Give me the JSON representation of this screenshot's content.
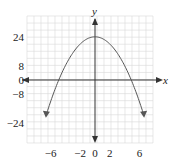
{
  "chart_data": {
    "type": "line",
    "title": "",
    "function": "y = 24 - x^2",
    "xlabel": "x",
    "ylabel": "y",
    "xlim": [
      -8.5,
      8.5
    ],
    "ylim": [
      -35,
      35
    ],
    "grid": true,
    "legend": null,
    "x_ticks": [
      {
        "value": -6,
        "label": "−6"
      },
      {
        "value": -2,
        "label": "−2"
      },
      {
        "value": 0,
        "label": "0"
      },
      {
        "value": 2,
        "label": "2"
      },
      {
        "value": 6,
        "label": "6"
      }
    ],
    "y_ticks": [
      {
        "value": 24,
        "label": "24"
      },
      {
        "value": 8,
        "label": "8"
      },
      {
        "value": 0,
        "label": "0"
      },
      {
        "value": -8,
        "label": "−8"
      },
      {
        "value": -24,
        "label": "−24"
      }
    ],
    "series": [
      {
        "name": "parabola",
        "x": [
          -6.6,
          -6,
          -5,
          -4,
          -3,
          -2,
          -1,
          0,
          1,
          2,
          3,
          4,
          5,
          6,
          6.6
        ],
        "y": [
          -19.6,
          -12,
          -1,
          8,
          15,
          20,
          23,
          24,
          23,
          20,
          15,
          8,
          -1,
          -12,
          -19.6
        ],
        "vertex": [
          0,
          24
        ],
        "x_intercepts": [
          -4.9,
          4.9
        ],
        "ends": "arrows"
      }
    ],
    "colors": {
      "curve": "#555555",
      "axis": "#333333",
      "grid": "#d9d9d9"
    }
  }
}
